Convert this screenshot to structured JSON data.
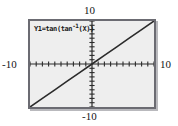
{
  "screen": {
    "device": "graphing-calculator",
    "background_color": "#ffffff",
    "viewport_fill": "#eeeeee",
    "frame_color": "#6b6b72",
    "curve_color": "#2b2b2b",
    "axis_color": "#2b2b2b"
  },
  "function_label": {
    "prefix": "Y1=tan(tan",
    "exponent": "-1",
    "suffix": "(X))",
    "full_text": "Y1=tan(tan-1(X))"
  },
  "axis_labels": {
    "y_max": "10",
    "y_min": "-10",
    "x_min": "-10",
    "x_max": "10"
  },
  "chart_data": {
    "type": "line",
    "title": "Y1=tan(tan-1(X))",
    "xlabel": "",
    "ylabel": "",
    "xlim": [
      -10,
      10
    ],
    "ylim": [
      -10,
      10
    ],
    "xtick_step": 1,
    "ytick_step": 1,
    "grid": false,
    "legend": "none",
    "axes_through_origin": true,
    "tick_marks": true,
    "series": [
      {
        "name": "Y1=tan(tan-1(X))",
        "equivalent": "y = x",
        "color": "#2b2b2b",
        "x": [
          -10,
          -8,
          -6,
          -4,
          -2,
          0,
          2,
          4,
          6,
          8,
          10
        ],
        "values": [
          -10,
          -8,
          -6,
          -4,
          -2,
          0,
          2,
          4,
          6,
          8,
          10
        ]
      }
    ],
    "annotations": [
      {
        "text": "10",
        "position": "top-center"
      },
      {
        "text": "-10",
        "position": "bottom-center"
      },
      {
        "text": "-10",
        "position": "left-middle"
      },
      {
        "text": "10",
        "position": "right-middle"
      }
    ]
  }
}
